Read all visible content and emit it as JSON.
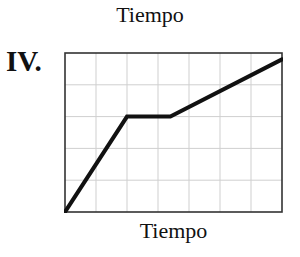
{
  "header": {
    "title": "Tiempo",
    "panel_label": "IV."
  },
  "chart_data": {
    "type": "line",
    "title": "Tiempo",
    "panel": "IV.",
    "xlabel": "Tiempo",
    "ylabel": "",
    "grid": true,
    "grid_columns": 7,
    "grid_rows": 5,
    "xlim": [
      0,
      7
    ],
    "ylim": [
      0,
      5
    ],
    "x": [
      0,
      2,
      3.4,
      7
    ],
    "y": [
      0,
      3,
      3,
      4.8
    ],
    "series": [
      {
        "name": "IV",
        "x": [
          0,
          2,
          3.4,
          7
        ],
        "y": [
          0,
          3,
          3,
          4.8
        ],
        "color": "#111111"
      }
    ],
    "legend": null,
    "tick_labels": {
      "x": [],
      "y": []
    }
  },
  "colors": {
    "line": "#111111",
    "frame": "#333333",
    "grid": "#cfcfcf",
    "background": "#ffffff"
  }
}
